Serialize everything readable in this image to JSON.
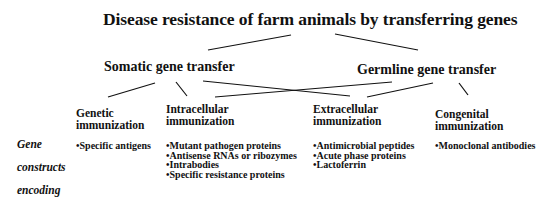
{
  "title": "Disease resistance of farm animals by transferring genes",
  "branches": {
    "somatic": "Somatic gene transfer",
    "germline": "Germline gene transfer"
  },
  "categories": [
    {
      "id": "genetic",
      "line1": "Genetic",
      "line2": "immunization",
      "items": [
        "Specific antigens"
      ]
    },
    {
      "id": "intracellular",
      "line1": "Intracellular",
      "line2": "immunization",
      "items": [
        "Mutant pathogen proteins",
        "Antisense RNAs or ribozymes",
        "Intrabodies",
        "Specific resistance proteins"
      ]
    },
    {
      "id": "extracellular",
      "line1": "Extracellular",
      "line2": "immunization",
      "items": [
        "Antimicrobial peptides",
        "Acute phase proteins",
        "Lactoferrin"
      ]
    },
    {
      "id": "congenital",
      "line1": "Congenital",
      "line2": "immunization",
      "items": [
        "Monoclonal antibodies"
      ]
    }
  ],
  "side_label": [
    "Gene",
    "constructs",
    "encoding"
  ],
  "edges": [
    {
      "from": "title",
      "to": "somatic"
    },
    {
      "from": "title",
      "to": "germline"
    },
    {
      "from": "somatic",
      "to": "genetic"
    },
    {
      "from": "somatic",
      "to": "intracellular"
    },
    {
      "from": "somatic",
      "to": "extracellular"
    },
    {
      "from": "germline",
      "to": "intracellular"
    },
    {
      "from": "germline",
      "to": "extracellular"
    },
    {
      "from": "germline",
      "to": "congenital"
    }
  ]
}
